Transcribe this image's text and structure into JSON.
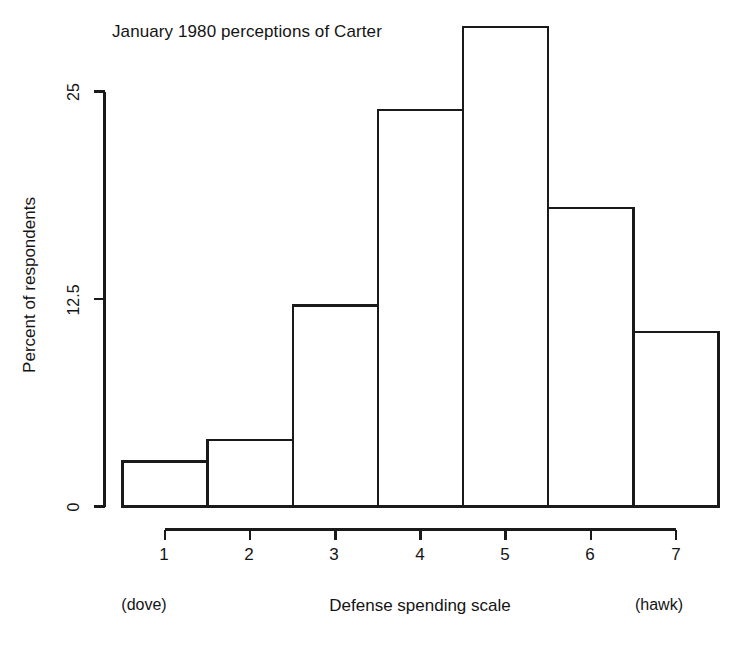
{
  "chart_data": {
    "type": "bar",
    "title": "January 1980 perceptions of Carter",
    "xlabel": "Defense spending scale",
    "ylabel": "Percent of respondents",
    "categories": [
      "1",
      "2",
      "3",
      "4",
      "5",
      "6",
      "7"
    ],
    "values": [
      2.7,
      4.0,
      12.1,
      23.9,
      28.9,
      18.0,
      10.5
    ],
    "ylim": [
      0,
      30
    ],
    "xlim": [
      0.5,
      7.5
    ],
    "ytick_values": [
      0,
      12.5,
      25
    ],
    "ytick_labels": [
      "0",
      "12.5",
      "25"
    ],
    "xtick_labels": [
      "1",
      "2",
      "3",
      "4",
      "5",
      "6",
      "7"
    ],
    "grid": false,
    "legend": "none",
    "annotations": {
      "left_anchor": "(dove)",
      "right_anchor": "(hawk)"
    },
    "style": {
      "bar_fill": "#ffffff",
      "bar_stroke": "#1a1a1a",
      "axis_color": "#1a1a1a",
      "background": "#ffffff"
    }
  },
  "axis": {
    "y_tick_0": "0",
    "y_tick_mid": "12.5",
    "y_tick_top": "25"
  },
  "x_ticks": {
    "t1": "1",
    "t2": "2",
    "t3": "3",
    "t4": "4",
    "t5": "5",
    "t6": "6",
    "t7": "7"
  },
  "labels": {
    "title": "January 1980 perceptions of Carter",
    "ylabel": "Percent of respondents",
    "xlabel": "Defense spending scale",
    "dove": "(dove)",
    "hawk": "(hawk)"
  }
}
